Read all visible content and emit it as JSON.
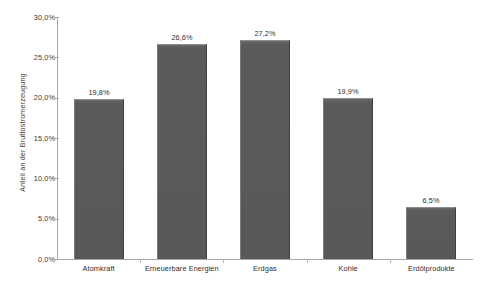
{
  "chart_data": {
    "type": "bar",
    "title": "",
    "xlabel": "",
    "ylabel": "Anteil an der Bruttostromerzeugung",
    "categories": [
      "Atomkraft",
      "Erneuerbare Energien",
      "Erdgas",
      "Kohle",
      "Erdölprodukte"
    ],
    "values": [
      19.8,
      26.6,
      27.2,
      19.9,
      6.5
    ],
    "value_labels": [
      "19,8%",
      "26,6%",
      "27,2%",
      "19,9%",
      "6,5%"
    ],
    "ylim": [
      0,
      30
    ],
    "ytick_values": [
      0,
      5,
      10,
      15,
      20,
      25,
      30
    ],
    "ytick_labels": [
      "0,0%",
      "5,0%",
      "10,0%",
      "15,0%",
      "20,0%",
      "25,0%",
      "30,0%"
    ],
    "grid": false,
    "legend": false,
    "series": [
      {
        "name": "Anteil an der Bruttostromerzeugung",
        "values": [
          19.8,
          26.6,
          27.2,
          19.9,
          6.5
        ],
        "color": "#5a5a5a"
      }
    ],
    "colors": {
      "bar_fill": "#5a5a5a",
      "bar_highlight": "#8d8d8d",
      "bar_shadow": "#3f3f3f",
      "axis": "#a8a8a8",
      "text": "#2e2e2e",
      "background": "#ffffff"
    }
  }
}
